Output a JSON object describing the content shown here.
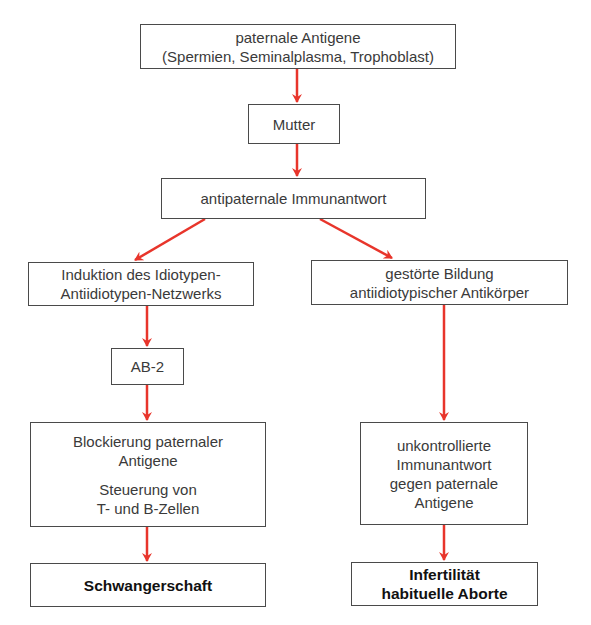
{
  "diagram": {
    "arrow_color": "#e8352b",
    "border_color": "#4a4a4a",
    "nodes": {
      "paternal_antigens": {
        "line1": "paternale Antigene",
        "line2": "(Spermien, Seminalplasma, Trophoblast)"
      },
      "mother": {
        "line1": "Mutter"
      },
      "antipaternal_response": {
        "line1": "antipaternale Immunantwort"
      },
      "idiotype_induction": {
        "line1": "Induktion des Idiotypen-",
        "line2": "Antiidiotypen-Netzwerks"
      },
      "disturbed_formation": {
        "line1": "gestörte Bildung",
        "line2": "antiidiotypischer Antikörper"
      },
      "ab2": {
        "line1": "AB-2"
      },
      "blocking": {
        "line1": "Blockierung paternaler",
        "line2": "Antigene",
        "line3": "Steuerung von",
        "line4": "T- und B-Zellen"
      },
      "uncontrolled": {
        "line1": "unkontrollierte",
        "line2": "Immunantwort",
        "line3": "gegen paternale",
        "line4": "Antigene"
      },
      "pregnancy": {
        "line1": "Schwangerschaft"
      },
      "infertility": {
        "line1": "Infertilität",
        "line2": "habituelle Aborte"
      }
    },
    "edges": [
      [
        "paternal_antigens",
        "mother"
      ],
      [
        "mother",
        "antipaternal_response"
      ],
      [
        "antipaternal_response",
        "idiotype_induction"
      ],
      [
        "antipaternal_response",
        "disturbed_formation"
      ],
      [
        "idiotype_induction",
        "ab2"
      ],
      [
        "ab2",
        "blocking"
      ],
      [
        "blocking",
        "pregnancy"
      ],
      [
        "disturbed_formation",
        "uncontrolled"
      ],
      [
        "uncontrolled",
        "infertility"
      ]
    ]
  }
}
